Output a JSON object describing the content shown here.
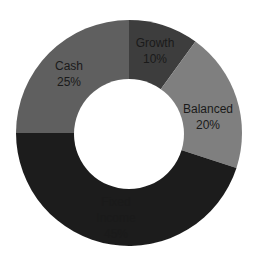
{
  "chart_data": {
    "type": "pie",
    "variant": "donut",
    "title": "",
    "legend": "none",
    "start_angle_deg": 0,
    "direction": "clockwise",
    "slices": [
      {
        "label": "Growth",
        "value": 10,
        "value_label": "10%",
        "color": "#3c3c3c"
      },
      {
        "label": "Balanced",
        "value": 20,
        "value_label": "20%",
        "color": "#7f7f7f"
      },
      {
        "label": "Fixed Income",
        "value": 45,
        "value_label": "45%",
        "color": "#1f1f1f"
      },
      {
        "label": "Cash",
        "value": 25,
        "value_label": "25%",
        "color": "#5f5f5f"
      }
    ]
  },
  "labels": {
    "growth": [
      "Growth",
      "10%"
    ],
    "balanced": [
      "Balanced",
      "20%"
    ],
    "fixed_income": [
      "Fixed",
      "Income",
      "45%"
    ],
    "cash": [
      "Cash",
      "25%"
    ]
  }
}
